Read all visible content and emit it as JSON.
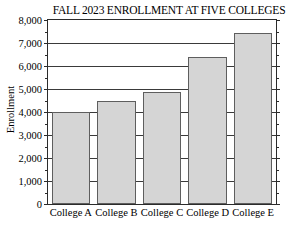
{
  "chart_data": {
    "type": "bar",
    "title": "FALL 2023 ENROLLMENT AT FIVE COLLEGES",
    "xlabel": "",
    "ylabel": "Enrollment",
    "categories": [
      "College A",
      "College B",
      "College C",
      "College D",
      "College E"
    ],
    "values": [
      4000,
      4480,
      4870,
      6380,
      7430
    ],
    "ylim": [
      0,
      8000
    ],
    "ytick_step": 1000,
    "yminor_step": 500,
    "ytick_labels": [
      "0",
      "1,000",
      "2,000",
      "3,000",
      "4,000",
      "5,000",
      "6,000",
      "7,000",
      "8,000"
    ],
    "ytick_values": [
      0,
      1000,
      2000,
      3000,
      4000,
      5000,
      6000,
      7000,
      8000
    ],
    "grid": true,
    "legend": false,
    "bar_fill_color": "#d5d5d5",
    "bar_border_color": "#5e5e5e",
    "axis_color": "#2b2b2b",
    "gridline_color": "#3a3a3a"
  }
}
